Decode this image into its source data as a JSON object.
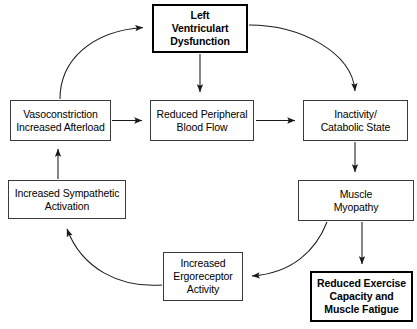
{
  "diagram": {
    "type": "flowchart",
    "canvas": {
      "width": 417,
      "height": 329,
      "background": "#ffffff"
    },
    "colors": {
      "box_stroke": "#3a3a3a",
      "emphasis_stroke": "#000000",
      "arrow_stroke": "#1a1a1a",
      "text": "#000000",
      "background": "#ffffff"
    },
    "nodes": [
      {
        "id": "lvd",
        "label": "Left\nVentriculart\nDysfunction",
        "emphasis": true
      },
      {
        "id": "vaso",
        "label": "Vasoconstriction\nIncreased Afterload",
        "emphasis": false
      },
      {
        "id": "rpbf",
        "label": "Reduced Peripheral\nBlood Flow",
        "emphasis": false
      },
      {
        "id": "inact",
        "label": "Inactivity/\nCatabolic State",
        "emphasis": false
      },
      {
        "id": "symp",
        "label": "Increased Sympathetic\nActivation",
        "emphasis": false
      },
      {
        "id": "myo",
        "label": "Muscle\nMyopathy",
        "emphasis": false
      },
      {
        "id": "ergo",
        "label": "Increased\nErgoreceptor\nActivity",
        "emphasis": false
      },
      {
        "id": "redex",
        "label": "Reduced Exercise\nCapacity and\nMuscle Fatigue",
        "emphasis": true
      }
    ],
    "edges": [
      {
        "id": "vaso-to-lvd",
        "from": "vaso",
        "to": "lvd",
        "style": "curved"
      },
      {
        "id": "lvd-to-inact",
        "from": "lvd",
        "to": "inact",
        "style": "curved"
      },
      {
        "id": "lvd-to-rpbf",
        "from": "lvd",
        "to": "rpbf",
        "style": "straight"
      },
      {
        "id": "vaso-to-rpbf",
        "from": "vaso",
        "to": "rpbf",
        "style": "straight"
      },
      {
        "id": "rpbf-to-inact",
        "from": "rpbf",
        "to": "inact",
        "style": "straight"
      },
      {
        "id": "symp-to-vaso",
        "from": "symp",
        "to": "vaso",
        "style": "straight"
      },
      {
        "id": "inact-to-myo",
        "from": "inact",
        "to": "myo",
        "style": "straight"
      },
      {
        "id": "myo-to-redex",
        "from": "myo",
        "to": "redex",
        "style": "straight"
      },
      {
        "id": "myo-to-ergo",
        "from": "myo",
        "to": "ergo",
        "style": "curved"
      },
      {
        "id": "ergo-to-symp",
        "from": "ergo",
        "to": "symp",
        "style": "curved"
      }
    ]
  }
}
